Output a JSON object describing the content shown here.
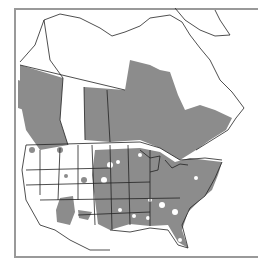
{
  "map": {
    "type": "species-distribution-range-map",
    "region": "North America",
    "colors": {
      "range_fill": "#8c8c8c",
      "background": "#ffffff",
      "outline": "#222222",
      "frame": "#999999"
    },
    "legend": null,
    "labels": []
  }
}
